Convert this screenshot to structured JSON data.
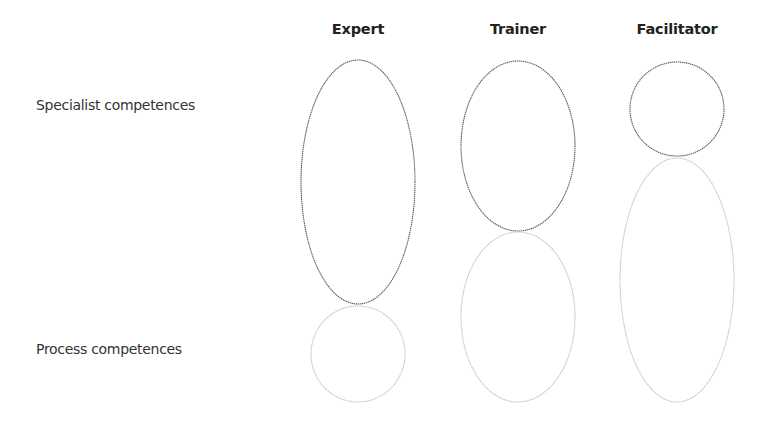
{
  "columns": [
    {
      "label": "Expert",
      "center_x": 358
    },
    {
      "label": "Trainer",
      "center_x": 518
    },
    {
      "label": "Facilitator",
      "center_x": 677
    }
  ],
  "rows": [
    {
      "label": "Specialist competences"
    },
    {
      "label": "Process competences"
    }
  ],
  "shapes": {
    "expert": {
      "specialist": {
        "cx": 358,
        "cy": 182,
        "rx": 57,
        "ry": 122,
        "emphasis": "strong"
      },
      "process": {
        "cx": 358,
        "cy": 354,
        "rx": 47,
        "ry": 48,
        "emphasis": "weak"
      }
    },
    "trainer": {
      "specialist": {
        "cx": 518,
        "cy": 146,
        "rx": 57,
        "ry": 85,
        "emphasis": "strong"
      },
      "process": {
        "cx": 518,
        "cy": 317,
        "rx": 57,
        "ry": 85,
        "emphasis": "weak"
      }
    },
    "facilitator": {
      "specialist": {
        "cx": 677,
        "cy": 109,
        "rx": 47,
        "ry": 47,
        "emphasis": "strong"
      },
      "process": {
        "cx": 677,
        "cy": 280,
        "rx": 57,
        "ry": 122,
        "emphasis": "weak"
      }
    }
  },
  "colors": {
    "strong_stroke": "#5a5a5a",
    "weak_stroke": "#c4c4c4",
    "text": "#333333"
  }
}
